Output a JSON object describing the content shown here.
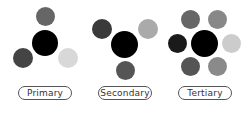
{
  "diagram": {
    "schemes": [
      {
        "label": "Primary",
        "center": {
          "x": 45,
          "y": 43,
          "r": 13,
          "color": "#000000"
        },
        "satellites": [
          {
            "x": 45.5,
            "y": 16.5,
            "r": 9.5,
            "color": "#666666"
          },
          {
            "x": 23,
            "y": 58,
            "r": 10,
            "color": "#444444"
          },
          {
            "x": 68,
            "y": 58,
            "r": 10,
            "color": "#d8d8d8"
          }
        ]
      },
      {
        "label": "Secondary",
        "center": {
          "x": 124.5,
          "y": 44.5,
          "r": 13.5,
          "color": "#000000"
        },
        "satellites": [
          {
            "x": 102,
            "y": 29,
            "r": 10,
            "color": "#3a3a3a"
          },
          {
            "x": 148,
            "y": 29,
            "r": 10,
            "color": "#aaaaaa"
          },
          {
            "x": 125,
            "y": 70.5,
            "r": 9.5,
            "color": "#555555"
          }
        ]
      },
      {
        "label": "Tertiary",
        "center": {
          "x": 204.5,
          "y": 43,
          "r": 13.5,
          "color": "#000000"
        },
        "satellites": [
          {
            "x": 190.5,
            "y": 19.5,
            "r": 9.5,
            "color": "#666666"
          },
          {
            "x": 217.5,
            "y": 19.5,
            "r": 9.5,
            "color": "#888888"
          },
          {
            "x": 177.5,
            "y": 43,
            "r": 9.5,
            "color": "#1a1a1a"
          },
          {
            "x": 231.5,
            "y": 43,
            "r": 9.5,
            "color": "#cccccc"
          },
          {
            "x": 190.5,
            "y": 66.5,
            "r": 9.5,
            "color": "#555555"
          },
          {
            "x": 217.5,
            "y": 66.5,
            "r": 9.5,
            "color": "#8a8a8a"
          }
        ]
      }
    ],
    "pill_positions": [
      18,
      98,
      178
    ]
  }
}
